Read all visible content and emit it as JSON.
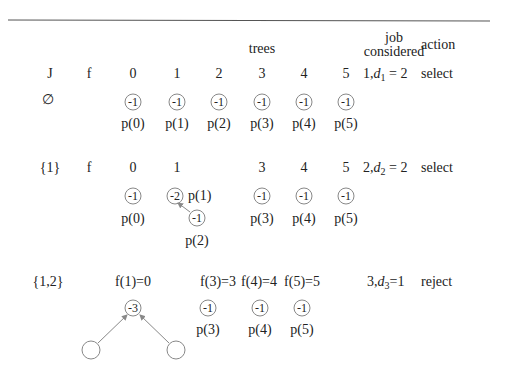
{
  "header": {
    "trees_label": "trees",
    "job_label": "job",
    "considered_label": "considered",
    "action_label": "action"
  },
  "rows": [
    {
      "J": "∅",
      "f": "f",
      "indices": [
        "0",
        "1",
        "2",
        "3",
        "4",
        "5"
      ],
      "nodes": [
        "-1",
        "-1",
        "-1",
        "-1",
        "-1",
        "-1"
      ],
      "pointers": [
        "p(0)",
        "p(1)",
        "p(2)",
        "p(3)",
        "p(4)",
        "p(5)"
      ],
      "job_considered": {
        "job": "1",
        "d": "d",
        "sub": "1",
        "eq": "= 2"
      },
      "action": "select"
    },
    {
      "J": "{1}",
      "f": "f",
      "indices": [
        "0",
        "1",
        "3",
        "4",
        "5"
      ],
      "nodes": [
        "-1",
        "-2",
        "-1",
        "-1",
        "-1",
        "-1"
      ],
      "pointers": [
        "p(0)",
        "p(1)",
        "p(2)",
        "p(3)",
        "p(4)",
        "p(5)"
      ],
      "job_considered": {
        "job": "2",
        "d": "d",
        "sub": "2",
        "eq": "= 2"
      },
      "action": "select"
    },
    {
      "J": "{1,2}",
      "f_values": [
        "f(1)=0",
        "f(3)=3",
        "f(4)=4",
        "f(5)=5"
      ],
      "nodes": [
        "-3",
        "-1",
        "-1",
        "-1",
        "",
        ""
      ],
      "pointers": [
        "p(3)",
        "p(4)",
        "p(5)"
      ],
      "job_considered": {
        "job": "3",
        "d": "d",
        "sub": "3",
        "eq": "=1"
      },
      "action": "reject"
    }
  ],
  "colors": {
    "line": "#555555",
    "circle": "#888888",
    "text": "#222222"
  }
}
